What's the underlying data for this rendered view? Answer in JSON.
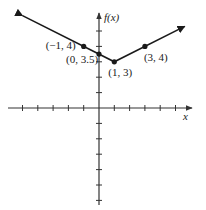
{
  "chart_data": {
    "type": "line",
    "title": "",
    "function": "f(x) = 0.5|x - 1| + 3",
    "xlabel": "x",
    "ylabel": "f(x)",
    "xlim": [
      -5,
      6
    ],
    "ylim": [
      -6,
      6
    ],
    "tick_spacing": 1,
    "x_ticks": [
      -5,
      -4,
      -3,
      -2,
      -1,
      1,
      2,
      3,
      4,
      5
    ],
    "y_ticks": [
      -6,
      -5,
      -4,
      -3,
      -2,
      -1,
      1,
      2,
      3,
      4,
      5
    ],
    "grid": false,
    "legend": null,
    "series": [
      {
        "name": "f(x)",
        "style": "line with arrows at both ends",
        "points": [
          {
            "x": -5,
            "y": 6
          },
          {
            "x": 1,
            "y": 3
          },
          {
            "x": 5.6,
            "y": 5.3
          }
        ]
      }
    ],
    "labeled_points": [
      {
        "x": -1,
        "y": 4,
        "label": "(−1, 4)"
      },
      {
        "x": 0,
        "y": 3.5,
        "label": "(0, 3.5)"
      },
      {
        "x": 1,
        "y": 3,
        "label": "(1, 3)"
      },
      {
        "x": 3,
        "y": 4,
        "label": "(3, 4)"
      }
    ]
  },
  "axis_labels": {
    "x": "x",
    "y": "f(x)"
  },
  "colors": {
    "line": "#1a1a1a",
    "axis": "#333333",
    "background": "#ffffff"
  }
}
